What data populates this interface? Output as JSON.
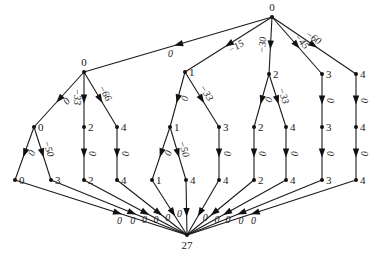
{
  "nodes": [
    {
      "id": "root",
      "label": "0"
    },
    {
      "id": "a",
      "label": "0"
    },
    {
      "id": "b",
      "label": "1"
    },
    {
      "id": "c",
      "label": "2"
    },
    {
      "id": "d",
      "label": "3"
    },
    {
      "id": "e",
      "label": "4"
    },
    {
      "id": "a0",
      "label": "0"
    },
    {
      "id": "a2",
      "label": "2"
    },
    {
      "id": "a4",
      "label": "4"
    },
    {
      "id": "b1",
      "label": "1"
    },
    {
      "id": "b3",
      "label": "3"
    },
    {
      "id": "c2",
      "label": "2"
    },
    {
      "id": "c4",
      "label": "4"
    },
    {
      "id": "d3",
      "label": "3"
    },
    {
      "id": "e4",
      "label": "4"
    },
    {
      "id": "l0",
      "label": "0"
    },
    {
      "id": "l3",
      "label": "3"
    },
    {
      "id": "l2",
      "label": "2"
    },
    {
      "id": "l4a",
      "label": "4"
    },
    {
      "id": "l1",
      "label": "1"
    },
    {
      "id": "l4b",
      "label": "4"
    },
    {
      "id": "l4c",
      "label": "4"
    },
    {
      "id": "l2b",
      "label": "2"
    },
    {
      "id": "l4d",
      "label": "4"
    },
    {
      "id": "l3b",
      "label": "3"
    },
    {
      "id": "l4e",
      "label": "4"
    },
    {
      "id": "sink",
      "label": "27"
    }
  ],
  "edges": [
    {
      "from": "root",
      "to": "a",
      "label": "0"
    },
    {
      "from": "root",
      "to": "b",
      "label": "−15"
    },
    {
      "from": "root",
      "to": "c",
      "label": "−30"
    },
    {
      "from": "root",
      "to": "d",
      "label": "−45"
    },
    {
      "from": "root",
      "to": "e",
      "label": "−60"
    },
    {
      "from": "a",
      "to": "a0",
      "label": "0"
    },
    {
      "from": "a",
      "to": "a2",
      "label": "−33"
    },
    {
      "from": "a",
      "to": "a4",
      "label": "−66"
    },
    {
      "from": "b",
      "to": "b1",
      "label": "0"
    },
    {
      "from": "b",
      "to": "b3",
      "label": "−33"
    },
    {
      "from": "c",
      "to": "c2",
      "label": "0"
    },
    {
      "from": "c",
      "to": "c4",
      "label": "−33"
    },
    {
      "from": "d",
      "to": "d3",
      "label": "0"
    },
    {
      "from": "e",
      "to": "e4",
      "label": "0"
    },
    {
      "from": "a0",
      "to": "l0",
      "label": "0"
    },
    {
      "from": "a0",
      "to": "l3",
      "label": "−50"
    },
    {
      "from": "a2",
      "to": "l2",
      "label": "0"
    },
    {
      "from": "a4",
      "to": "l4a",
      "label": "0"
    },
    {
      "from": "b1",
      "to": "l1",
      "label": "0"
    },
    {
      "from": "b1",
      "to": "l4b",
      "label": "−50"
    },
    {
      "from": "b3",
      "to": "l4c",
      "label": "0"
    },
    {
      "from": "c2",
      "to": "l2b",
      "label": "0"
    },
    {
      "from": "c4",
      "to": "l4d",
      "label": "0"
    },
    {
      "from": "d3",
      "to": "l3b",
      "label": "0"
    },
    {
      "from": "e4",
      "to": "l4e",
      "label": "0"
    },
    {
      "from": "l0",
      "to": "sink",
      "label": "0"
    },
    {
      "from": "l3",
      "to": "sink",
      "label": "0"
    },
    {
      "from": "l2",
      "to": "sink",
      "label": "0"
    },
    {
      "from": "l4a",
      "to": "sink",
      "label": "0"
    },
    {
      "from": "l1",
      "to": "sink",
      "label": "0"
    },
    {
      "from": "l4b",
      "to": "sink",
      "label": "0"
    },
    {
      "from": "l4c",
      "to": "sink",
      "label": "0"
    },
    {
      "from": "l2b",
      "to": "sink",
      "label": "0"
    },
    {
      "from": "l4d",
      "to": "sink",
      "label": "0"
    },
    {
      "from": "l3b",
      "to": "sink",
      "label": "0"
    },
    {
      "from": "l4e",
      "to": "sink",
      "label": "0"
    }
  ]
}
